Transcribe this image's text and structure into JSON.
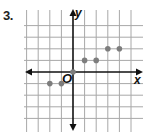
{
  "problem": {
    "number": "3."
  },
  "chart_data": {
    "type": "scatter",
    "title": "",
    "xlabel": "x",
    "ylabel": "y",
    "origin_label": "O",
    "xlim": [
      -4,
      5
    ],
    "ylim": [
      -4,
      4
    ],
    "grid": true,
    "tick_labels_shown": false,
    "points": [
      {
        "x": -2,
        "y": -1
      },
      {
        "x": -1,
        "y": -1
      },
      {
        "x": 0,
        "y": 0
      },
      {
        "x": 1,
        "y": 1
      },
      {
        "x": 2,
        "y": 1
      },
      {
        "x": 3,
        "y": 2
      },
      {
        "x": 4,
        "y": 2
      }
    ],
    "x": [
      -2,
      -1,
      0,
      1,
      2,
      3,
      4
    ],
    "y": [
      -1,
      -1,
      0,
      1,
      1,
      2,
      2
    ],
    "colors": {
      "grid": "#a8a8a8",
      "axes": "#111111",
      "points": "#7d7d7d"
    }
  }
}
